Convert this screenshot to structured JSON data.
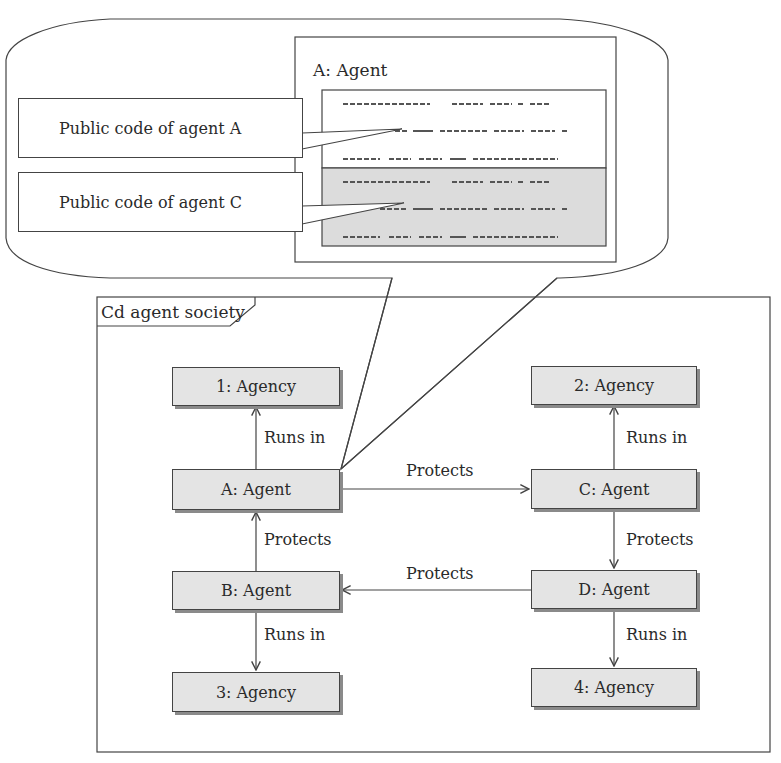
{
  "diagram": {
    "zoom_bubble": {
      "object_title": "A: Agent",
      "callouts": [
        {
          "label": "Public code of agent A"
        },
        {
          "label": "Public code of agent C"
        }
      ]
    },
    "frame": {
      "title": "Cd agent society"
    },
    "nodes": {
      "agency1": "1: Agency",
      "agency2": "2: Agency",
      "agency3": "3: Agency",
      "agency4": "4: Agency",
      "agentA": "A: Agent",
      "agentB": "B: Agent",
      "agentC": "C: Agent",
      "agentD": "D: Agent"
    },
    "edges": {
      "a_runs_in_1": "Runs in",
      "c_runs_in_2": "Runs in",
      "a_protects_c": "Protects",
      "b_protects_a": "Protects",
      "c_protects_d": "Protects",
      "d_protects_b": "Protects",
      "b_runs_in_3": "Runs in",
      "d_runs_in_4": "Runs in"
    },
    "colors": {
      "node_fill": "#e4e4e4",
      "stroke": "#444444",
      "shaded_code": "#dcdcdc"
    }
  }
}
